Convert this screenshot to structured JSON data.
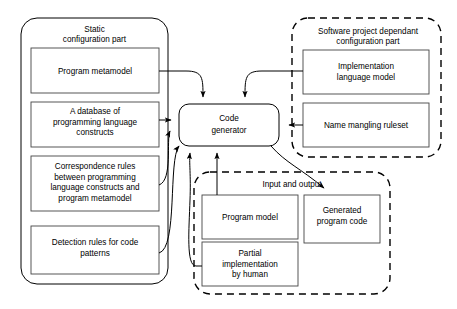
{
  "diagram": {
    "groups": [
      {
        "id": "static-configuration-part",
        "label": "Static\nconfiguration part",
        "label_line1": "Static",
        "label_line2": "configuration part",
        "border_style": "solid",
        "items": [
          {
            "id": "program-metamodel",
            "label_lines": [
              "Program metamodel"
            ]
          },
          {
            "id": "database-of-programming-language-constructs",
            "label_lines": [
              "A database of",
              "programming language",
              "constructs"
            ]
          },
          {
            "id": "correspondence-rules",
            "label_lines": [
              "Correspondence rules",
              "between programming",
              "language constructs and",
              "program metamodel"
            ]
          },
          {
            "id": "detection-rules-for-code-patterns",
            "label_lines": [
              "Detection rules for code",
              "patterns"
            ]
          }
        ]
      },
      {
        "id": "software-project-dependant-configuration-part",
        "label_line1": "Software project dependant",
        "label_line2": "configuration part",
        "border_style": "dashed",
        "items": [
          {
            "id": "implementation-language-model",
            "label_lines": [
              "Implementation",
              "language model"
            ]
          },
          {
            "id": "name-mangling-ruleset",
            "label_lines": [
              "Name mangling ruleset"
            ]
          }
        ]
      },
      {
        "id": "input-and-output",
        "label_line1": "Input and output",
        "label_line2": "",
        "border_style": "dashed",
        "items": [
          {
            "id": "program-model",
            "label_lines": [
              "Program model"
            ]
          },
          {
            "id": "partial-implementation-by-human",
            "label_lines": [
              "Partial",
              "implementation",
              "by human"
            ]
          },
          {
            "id": "generated-program-code",
            "label_lines": [
              "Generated",
              "program code"
            ]
          }
        ]
      }
    ],
    "center_node": {
      "id": "code-generator",
      "label_line1": "Code",
      "label_line2": "generator"
    },
    "connections": [
      {
        "from": "program-metamodel",
        "to": "code-generator",
        "arrow": "to"
      },
      {
        "from": "database-of-programming-language-constructs",
        "to": "code-generator",
        "arrow": "to"
      },
      {
        "from": "correspondence-rules",
        "to": "code-generator",
        "arrow": "to"
      },
      {
        "from": "detection-rules-for-code-patterns",
        "to": "code-generator",
        "arrow": "to"
      },
      {
        "from": "implementation-language-model",
        "to": "code-generator",
        "arrow": "to"
      },
      {
        "from": "name-mangling-ruleset",
        "to": "code-generator",
        "arrow": "to"
      },
      {
        "from": "program-model",
        "to": "code-generator",
        "arrow": "to"
      },
      {
        "from": "partial-implementation-by-human",
        "to": "code-generator",
        "arrow": "to"
      },
      {
        "from": "code-generator",
        "to": "generated-program-code",
        "arrow": "to"
      }
    ],
    "colors": {
      "stroke": "#000000",
      "item_stroke": "#444444",
      "background": "#ffffff",
      "text": "#000000"
    }
  }
}
